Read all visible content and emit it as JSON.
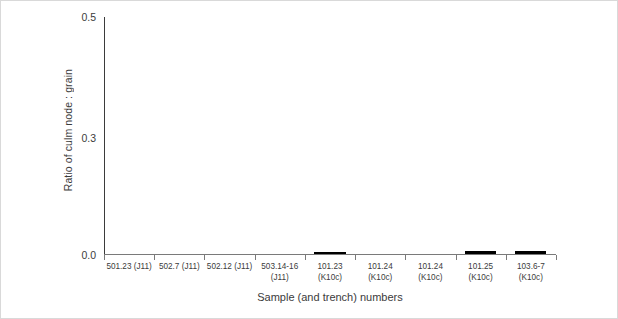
{
  "chart_data": {
    "type": "bar",
    "title": "",
    "xlabel": "Sample (and trench) numbers",
    "ylabel": "Ratio of culm node : grain",
    "ylim": [
      0.0,
      0.5
    ],
    "ytick_labels": [
      "0.5",
      "0.3",
      "0.0"
    ],
    "ytick_values": [
      0.5,
      0.3,
      0.0
    ],
    "grid": false,
    "legend": "none",
    "bar_color": "#000000",
    "categories": [
      "501.23 (J11)",
      "502.7 (J11)",
      "502.12 (J11)",
      "503.14-16 (J11)",
      "101.23 (K10c)",
      "101.24 (K10c)",
      "101.24 (K10c)",
      "101.25 (K10c)",
      "103.6-7 (K10c)"
    ],
    "category_lines": [
      [
        "501.23 (J11)"
      ],
      [
        "502.7 (J11)"
      ],
      [
        "502.12 (J11)"
      ],
      [
        "503.14-16",
        "(J11)"
      ],
      [
        "101.23",
        "(K10c)"
      ],
      [
        "101.24",
        "(K10c)"
      ],
      [
        "101.24",
        "(K10c)"
      ],
      [
        "101.25",
        "(K10c)"
      ],
      [
        "103.6-7",
        "(K10c)"
      ]
    ],
    "values": [
      0,
      0,
      0,
      0,
      0.004,
      0,
      0,
      0.006,
      0.006
    ]
  }
}
